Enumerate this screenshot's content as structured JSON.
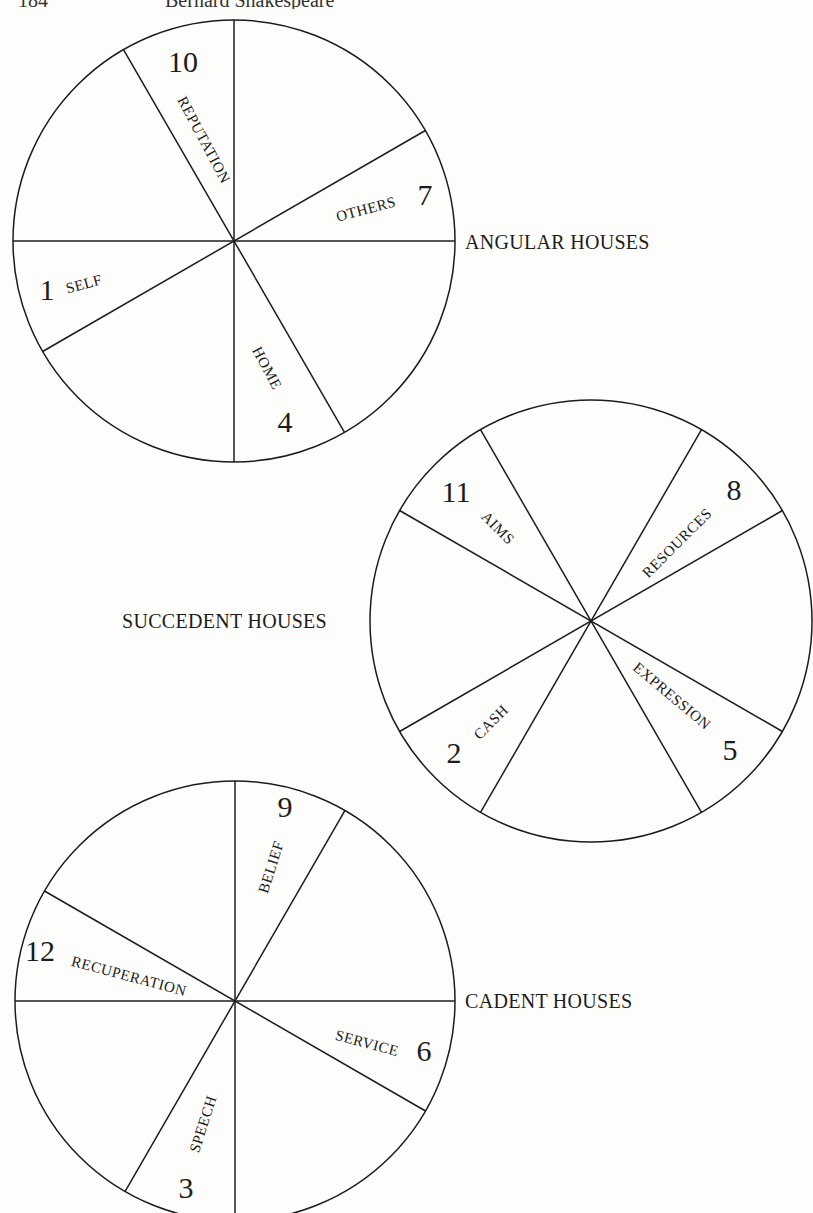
{
  "header": {
    "page_number": "184",
    "running_head": "Bernard Shakespeare"
  },
  "colors": {
    "ink": "#1c1c1c",
    "paper": "#fdfdfb"
  },
  "wheels": [
    {
      "id": "angular",
      "group_label": "ANGULAR HOUSES",
      "center": [
        234,
        241
      ],
      "radius": 221,
      "spoke_angles_deg": [
        0,
        90,
        30,
        120
      ],
      "group_label_pos": [
        465,
        249
      ],
      "houses": [
        {
          "number": "10",
          "name": "REPUTATION",
          "num_pos": [
            183,
            72
          ],
          "name_pos": [
            204,
            140
          ],
          "name_rot": 62
        },
        {
          "number": "7",
          "name": "OTHERS",
          "num_pos": [
            425,
            205
          ],
          "name_pos": [
            366,
            209
          ],
          "name_rot": -15
        },
        {
          "number": "1",
          "name": "SELF",
          "num_pos": [
            47,
            300
          ],
          "name_pos": [
            84,
            284
          ],
          "name_rot": -15
        },
        {
          "number": "4",
          "name": "HOME",
          "num_pos": [
            285,
            432
          ],
          "name_pos": [
            267,
            368
          ],
          "name_rot": 62
        }
      ]
    },
    {
      "id": "succedent",
      "group_label": "SUCCEDENT HOUSES",
      "center": [
        591,
        621
      ],
      "radius": 221,
      "spoke_angles_deg": [
        30,
        60,
        120,
        150
      ],
      "group_label_pos": [
        122,
        628
      ],
      "houses": [
        {
          "number": "11",
          "name": "AIMS",
          "num_pos": [
            456,
            502
          ],
          "name_pos": [
            498,
            528
          ],
          "name_rot": 45
        },
        {
          "number": "8",
          "name": "RESOURCES",
          "num_pos": [
            734,
            500
          ],
          "name_pos": [
            677,
            543
          ],
          "name_rot": -45
        },
        {
          "number": "2",
          "name": "CASH",
          "num_pos": [
            454,
            763
          ],
          "name_pos": [
            491,
            722
          ],
          "name_rot": -45
        },
        {
          "number": "5",
          "name": "EXPRESSION",
          "num_pos": [
            730,
            760
          ],
          "name_pos": [
            672,
            696
          ],
          "name_rot": 40
        }
      ]
    },
    {
      "id": "cadent",
      "group_label": "CADENT HOUSES",
      "center": [
        235,
        1001
      ],
      "radius": 220,
      "spoke_angles_deg": [
        0,
        90,
        60,
        150
      ],
      "group_label_pos": [
        465,
        1008
      ],
      "houses": [
        {
          "number": "9",
          "name": "BELIEF",
          "num_pos": [
            285,
            817
          ],
          "name_pos": [
            271,
            867
          ],
          "name_rot": -72
        },
        {
          "number": "12",
          "name": "RECUPERATION",
          "num_pos": [
            40,
            961
          ],
          "name_pos": [
            129,
            976
          ],
          "name_rot": 15
        },
        {
          "number": "6",
          "name": "SERVICE",
          "num_pos": [
            424,
            1061
          ],
          "name_pos": [
            367,
            1043
          ],
          "name_rot": 15
        },
        {
          "number": "3",
          "name": "SPEECH",
          "num_pos": [
            186,
            1198
          ],
          "name_pos": [
            203,
            1124
          ],
          "name_rot": -72
        }
      ]
    }
  ]
}
